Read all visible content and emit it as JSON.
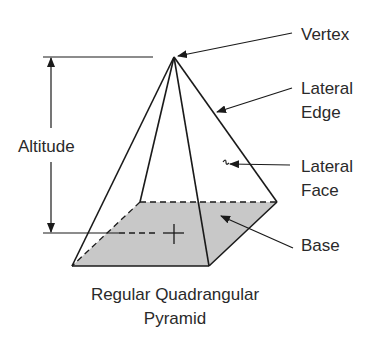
{
  "diagram": {
    "title": "Regular Quadrangular Pyramid",
    "caption_line1": "Regular Quadrangular",
    "caption_line2": "Pyramid",
    "labels": {
      "vertex": "Vertex",
      "lateral_edge_1": "Lateral",
      "lateral_edge_2": "Edge",
      "lateral_face_1": "Lateral",
      "lateral_face_2": "Face",
      "base": "Base",
      "altitude": "Altitude"
    },
    "colors": {
      "line": "#1a1a1a",
      "base_fill": "#c8c8c8",
      "text": "#2a2a2a",
      "background": "#ffffff"
    }
  }
}
